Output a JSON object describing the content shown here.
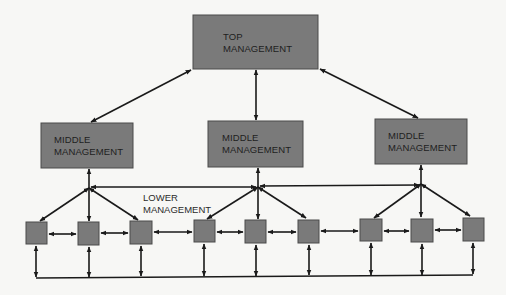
{
  "diagram": {
    "type": "organizational communication flow",
    "colors": {
      "box_fill": "#7a7a7a",
      "box_stroke": "#4a4a4a",
      "line": "#1a1a1a",
      "background": "#f7f7f5"
    },
    "top": {
      "line1": "TOP",
      "line2": "MANAGEMENT"
    },
    "middle": [
      {
        "line1": "MIDDLE",
        "line2": "MANAGEMENT"
      },
      {
        "line1": "MIDDLE",
        "line2": "MANAGEMENT"
      },
      {
        "line1": "MIDDLE",
        "line2": "MANAGEMENT"
      }
    ],
    "lower": {
      "line1": "LOWER",
      "line2": "MANAGEMENT",
      "unit_count": 9
    }
  }
}
